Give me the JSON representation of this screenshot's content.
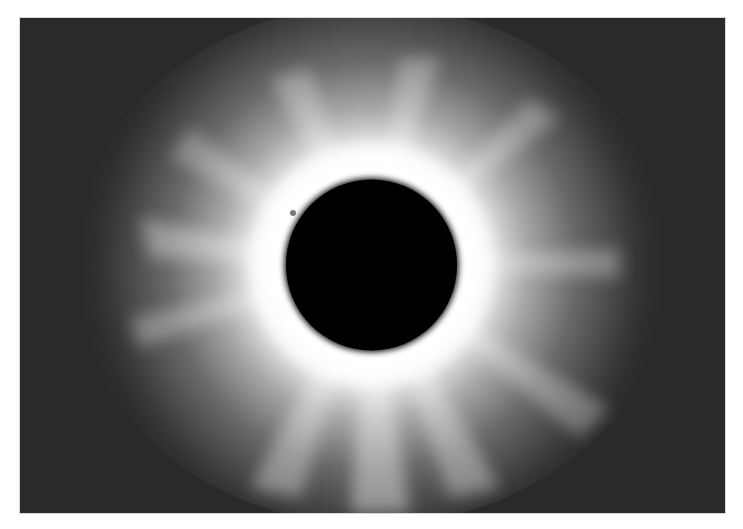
{
  "image": {
    "subject": "Total solar eclipse with corona",
    "colors": {
      "page_background": "#ffffff",
      "sky": "#2a2a2a",
      "corona_inner": "#ffffff",
      "moon_disk": "#000000"
    },
    "photo_frame": {
      "x": 20,
      "y": 18,
      "width": 705,
      "height": 495
    },
    "moon": {
      "cx": 371.5,
      "cy": 265,
      "r": 87
    },
    "prominence": {
      "x": 293,
      "y": 213
    }
  }
}
